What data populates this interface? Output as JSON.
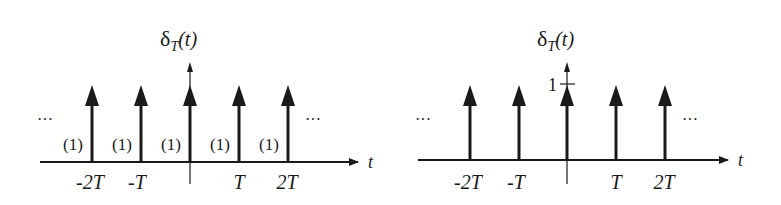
{
  "diagrams": [
    {
      "title_symbol": "δ",
      "title_sub": "T",
      "title_arg": "(t)",
      "axis_label": "t",
      "ellipsis_left": "···",
      "ellipsis_right": "···",
      "impulse_weights": [
        "(1)",
        "(1)",
        "(1)",
        "(1)",
        "(1)"
      ],
      "tick_labels": [
        "-2T",
        "-T",
        "T",
        "2T"
      ]
    },
    {
      "title_symbol": "δ",
      "title_sub": "T",
      "title_arg": "(t)",
      "axis_label": "t",
      "ellipsis_left": "···",
      "ellipsis_right": "···",
      "y_tick_label": "1",
      "tick_labels": [
        "-2T",
        "-T",
        "T",
        "2T"
      ]
    }
  ],
  "colors": {
    "ink": "#1a1a1a",
    "background": "#ffffff"
  }
}
